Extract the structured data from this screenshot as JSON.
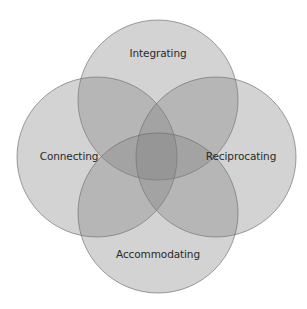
{
  "diagram": {
    "type": "venn",
    "sets": [
      {
        "id": "integrating",
        "label": "Integrating",
        "cx": 158,
        "cy": 100,
        "r": 80,
        "label_x": 158,
        "label_y": 57
      },
      {
        "id": "connecting",
        "label": "Connecting",
        "cx": 97,
        "cy": 157,
        "r": 80,
        "label_x": 69,
        "label_y": 160
      },
      {
        "id": "reciprocating",
        "label": "Reciprocating",
        "cx": 216,
        "cy": 157,
        "r": 80,
        "label_x": 241,
        "label_y": 160
      },
      {
        "id": "accommodating",
        "label": "Accommodating",
        "cx": 158,
        "cy": 213,
        "r": 80,
        "label_x": 158,
        "label_y": 258
      }
    ],
    "colors": {
      "background": "#ffffff",
      "fill": "#7e7e7e",
      "stroke": "#6a6a6a",
      "text": "#2a2a2a"
    }
  }
}
